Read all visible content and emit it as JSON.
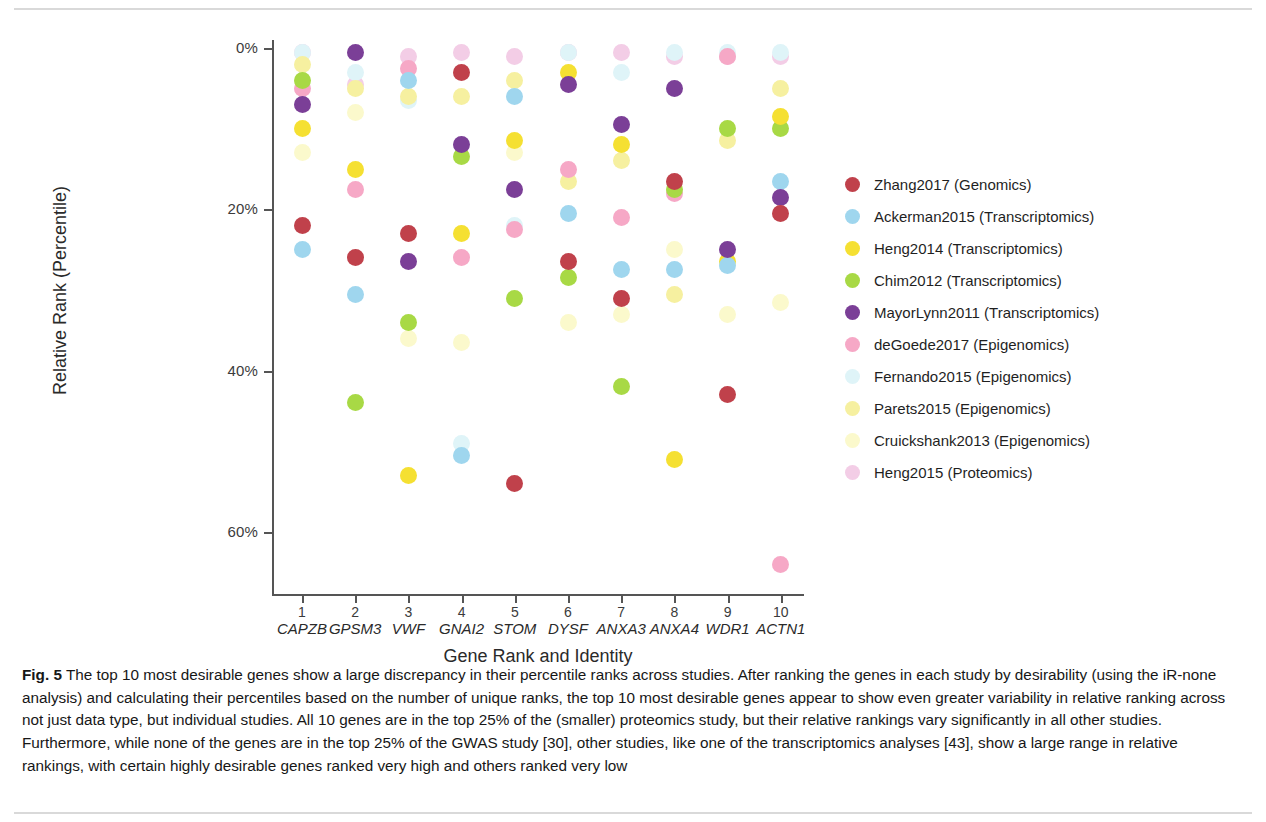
{
  "figure": {
    "label": "Fig. 5",
    "caption": "The top 10 most desirable genes show a large discrepancy in their percentile ranks across studies. After ranking the genes in each study by desirability (using the iR-none analysis) and calculating their percentiles based on the number of unique ranks, the top 10 most desirable genes appear to show even greater variability in relative ranking across not just data type, but individual studies. All 10 genes are in the top 25% of the (smaller) proteomics study, but their relative rankings vary significantly in all other studies. Furthermore, while none of the genes are in the top 25% of the GWAS study [30], other studies, like one of the transcriptomics analyses [43], show a large range in relative rankings, with certain highly desirable genes ranked very high and others ranked very low"
  },
  "chart_data": {
    "type": "scatter",
    "title": "",
    "xlabel": "Gene Rank and Identity",
    "ylabel": "Relative Rank (Percentile)",
    "ylim": [
      0,
      68
    ],
    "yticks": [
      0,
      20,
      40,
      60
    ],
    "ytick_labels": [
      "0%",
      "20%",
      "40%",
      "60%"
    ],
    "y_inverted": true,
    "grid": false,
    "legend_position": "right",
    "xticks": [
      1,
      2,
      3,
      4,
      5,
      6,
      7,
      8,
      9,
      10
    ],
    "categories": [
      {
        "rank": "1",
        "gene": "CAPZB"
      },
      {
        "rank": "2",
        "gene": "GPSM3"
      },
      {
        "rank": "3",
        "gene": "VWF"
      },
      {
        "rank": "4",
        "gene": "GNAI2"
      },
      {
        "rank": "5",
        "gene": "STOM"
      },
      {
        "rank": "6",
        "gene": "DYSF"
      },
      {
        "rank": "7",
        "gene": "ANXA3"
      },
      {
        "rank": "8",
        "gene": "ANXA4"
      },
      {
        "rank": "9",
        "gene": "WDR1"
      },
      {
        "rank": "10",
        "gene": "ACTN1"
      }
    ],
    "series": [
      {
        "name": "Zhang2017 (Genomics)",
        "color": "#c0414b",
        "values": [
          22.0,
          26.0,
          23.0,
          3.0,
          54.0,
          26.5,
          31.0,
          16.5,
          43.0,
          20.5
        ]
      },
      {
        "name": "Ackerman2015 (Transcriptomics)",
        "color": "#9fd6ee",
        "values": [
          25.0,
          30.5,
          4.0,
          50.5,
          6.0,
          20.5,
          27.5,
          27.5,
          27.0,
          16.5
        ]
      },
      {
        "name": "Heng2014 (Transcriptomics)",
        "color": "#f5e032",
        "values": [
          10.0,
          15.0,
          53.0,
          23.0,
          11.5,
          3.0,
          12.0,
          51.0,
          26.5,
          8.5
        ]
      },
      {
        "name": "Chim2012 (Transcriptomics)",
        "color": "#a8d945",
        "values": [
          4.0,
          44.0,
          34.0,
          13.5,
          31.0,
          28.5,
          42.0,
          17.5,
          10.0,
          10.0
        ]
      },
      {
        "name": "MayorLynn2011 (Transcriptomics)",
        "color": "#7b3f97",
        "values": [
          7.0,
          0.5,
          26.5,
          12.0,
          17.5,
          4.5,
          9.5,
          5.0,
          25.0,
          18.5
        ]
      },
      {
        "name": "deGoede2017 (Epigenomics)",
        "color": "#f6a8c6",
        "values": [
          5.0,
          17.5,
          2.5,
          26.0,
          22.5,
          15.0,
          21.0,
          18.0,
          1.0,
          64.0
        ]
      },
      {
        "name": "Fernando2015 (Epigenomics)",
        "color": "#dff4f8",
        "values": [
          0.5,
          3.0,
          6.5,
          49.0,
          22.0,
          0.5,
          3.0,
          0.5,
          0.5,
          0.5
        ]
      },
      {
        "name": "Parets2015 (Epigenomics)",
        "color": "#f6f0a0",
        "values": [
          2.0,
          5.0,
          6.0,
          6.0,
          4.0,
          16.5,
          14.0,
          30.5,
          11.5,
          5.0
        ]
      },
      {
        "name": "Cruickshank2013 (Epigenomics)",
        "color": "#fbf9cc",
        "values": [
          13.0,
          8.0,
          36.0,
          36.5,
          13.0,
          34.0,
          33.0,
          25.0,
          33.0,
          31.5
        ]
      },
      {
        "name": "Heng2015 (Proteomics)",
        "color": "#f3cde6",
        "values": [
          0.5,
          4.5,
          1.0,
          0.5,
          1.0,
          0.5,
          0.5,
          1.0,
          1.0,
          1.0
        ]
      }
    ]
  }
}
